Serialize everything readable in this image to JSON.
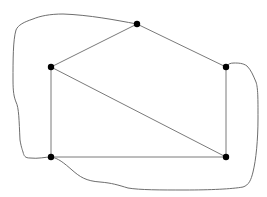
{
  "diagram": {
    "type": "graph",
    "width": 267,
    "height": 197,
    "background": "#ffffff",
    "colors": {
      "edge": "#7a7a7a",
      "curve": "#6e6e6e",
      "vertex": "#000000"
    },
    "vertex_radius": 3.2,
    "vertices": [
      {
        "id": "top",
        "x": 137,
        "y": 24
      },
      {
        "id": "left",
        "x": 51,
        "y": 67
      },
      {
        "id": "right",
        "x": 226,
        "y": 67
      },
      {
        "id": "bottom-left",
        "x": 51,
        "y": 157
      },
      {
        "id": "bottom-right",
        "x": 226,
        "y": 157
      }
    ],
    "edges": [
      {
        "from": "left",
        "to": "top"
      },
      {
        "from": "top",
        "to": "right"
      },
      {
        "from": "left",
        "to": "bottom-left"
      },
      {
        "from": "left",
        "to": "bottom-right"
      },
      {
        "from": "right",
        "to": "bottom-right"
      },
      {
        "from": "bottom-left",
        "to": "bottom-right"
      }
    ],
    "closed_curve": {
      "description": "hand-drawn closed curve surrounding the graph, passing through the top, right and bottom-left vertices",
      "path": "M137,24 C115,20 90,15 63,14 C50,14 40,16 33,19 C24,22 18,25 16,30 C13,40 13,60 13,80 C13,92 14,97 16,102 C19,108 19,120 20,140 C21,146 22,149 23,152 C24,156 25,158 30,158 C38,159 45,157 51,157 C58,158 64,163 72,170 C80,177 86,181 100,182 C112,183 118,185 128,188 C140,190 160,190 185,190 C210,190 232,189 243,187 C249,185 251,180 253,172 C256,160 258,140 258,118 C258,98 258,88 256,82 C253,75 251,70 247,66 C243,63 238,63 234,63 C230,63 228,64 226,67"
    }
  }
}
